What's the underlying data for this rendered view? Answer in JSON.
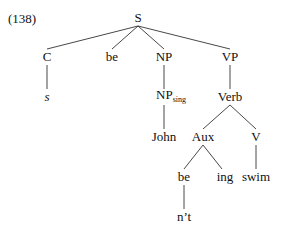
{
  "example_number": "(138)",
  "nodes": {
    "S": "S",
    "C": "C",
    "be1": "be",
    "NP": "NP",
    "VP": "VP",
    "s": "s",
    "NPsing_base": "NP",
    "NPsing_sub": "sing",
    "Verb": "Verb",
    "John": "John",
    "Aux": "Aux",
    "V": "V",
    "be2": "be",
    "ing": "ing",
    "swim": "swim",
    "nt": "n’t"
  }
}
